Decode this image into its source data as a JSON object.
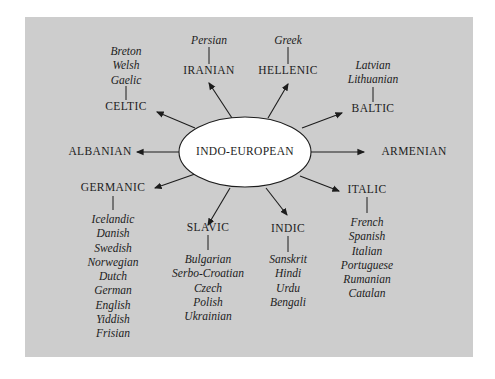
{
  "diagram": {
    "root": "INDO-EUROPEAN",
    "branches": [
      {
        "name": "CELTIC",
        "languages": [
          "Breton",
          "Welsh",
          "Gaelic"
        ]
      },
      {
        "name": "IRANIAN",
        "languages": [
          "Persian"
        ]
      },
      {
        "name": "HELLENIC",
        "languages": [
          "Greek"
        ]
      },
      {
        "name": "BALTIC",
        "languages": [
          "Latvian",
          "Lithuanian"
        ]
      },
      {
        "name": "ALBANIAN",
        "languages": []
      },
      {
        "name": "ARMENIAN",
        "languages": []
      },
      {
        "name": "GERMANIC",
        "languages": [
          "Icelandic",
          "Danish",
          "Swedish",
          "Norwegian",
          "Dutch",
          "German",
          "English",
          "Yiddish",
          "Frisian"
        ]
      },
      {
        "name": "SLAVIC",
        "languages": [
          "Bulgarian",
          "Serbo-Croatian",
          "Czech",
          "Polish",
          "Ukrainian"
        ]
      },
      {
        "name": "INDIC",
        "languages": [
          "Sanskrit",
          "Hindi",
          "Urdu",
          "Bengali"
        ]
      },
      {
        "name": "ITALIC",
        "languages": [
          "French",
          "Spanish",
          "Italian",
          "Portuguese",
          "Rumanian",
          "Catalan"
        ]
      }
    ]
  },
  "colors": {
    "panel": "#cdcdcd",
    "ellipse": "#ffffff",
    "ink": "#1c1c1c"
  }
}
